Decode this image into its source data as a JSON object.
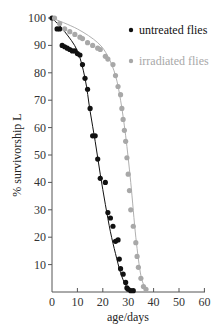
{
  "chart_data": {
    "type": "scatter",
    "title": "",
    "xlabel": "age/days",
    "ylabel": "% survivorship L",
    "xlim": [
      0,
      60
    ],
    "ylim": [
      0,
      100
    ],
    "xticks": [
      0,
      10,
      20,
      30,
      40,
      50,
      60
    ],
    "yticks": [
      10,
      20,
      30,
      40,
      50,
      60,
      70,
      80,
      90,
      100
    ],
    "grid": false,
    "legend_position": "upper right",
    "series": [
      {
        "name": "untreated flies",
        "color": "#111111",
        "marker": "filled-circle",
        "points": [
          [
            0,
            100
          ],
          [
            2,
            96
          ],
          [
            3,
            96
          ],
          [
            4,
            90
          ],
          [
            5,
            89.5
          ],
          [
            6,
            89
          ],
          [
            7,
            88.5
          ],
          [
            8,
            88
          ],
          [
            9,
            88
          ],
          [
            10,
            87
          ],
          [
            11,
            86.5
          ],
          [
            12,
            83
          ],
          [
            13,
            78
          ],
          [
            14,
            74
          ],
          [
            15,
            67
          ],
          [
            16,
            57
          ],
          [
            17,
            57
          ],
          [
            18,
            48.5
          ],
          [
            19,
            41.5
          ],
          [
            21,
            40
          ],
          [
            22,
            29
          ],
          [
            23,
            27
          ],
          [
            24,
            24
          ],
          [
            25,
            18.5
          ],
          [
            26,
            19
          ],
          [
            26.5,
            12
          ],
          [
            27,
            8.5
          ],
          [
            28,
            6.5
          ],
          [
            29,
            3.5
          ],
          [
            29.5,
            1.5
          ],
          [
            30,
            1
          ],
          [
            31,
            0.5
          ],
          [
            32,
            0.5
          ]
        ],
        "fit_curve": [
          [
            0,
            100
          ],
          [
            5,
            95
          ],
          [
            10,
            88
          ],
          [
            13,
            78
          ],
          [
            15,
            66
          ],
          [
            17,
            55
          ],
          [
            19,
            43
          ],
          [
            21,
            32
          ],
          [
            23,
            22
          ],
          [
            25,
            14
          ],
          [
            27,
            7
          ],
          [
            29,
            2.5
          ],
          [
            31,
            0.5
          ]
        ]
      },
      {
        "name": "irradiated flies",
        "color": "#a8a8a8",
        "marker": "filled-circle",
        "points": [
          [
            1,
            100
          ],
          [
            3,
            98
          ],
          [
            5,
            96
          ],
          [
            7,
            95
          ],
          [
            9,
            94
          ],
          [
            11,
            93
          ],
          [
            12,
            92.5
          ],
          [
            14,
            91
          ],
          [
            16,
            90
          ],
          [
            18,
            89
          ],
          [
            19,
            88.5
          ],
          [
            21,
            86
          ],
          [
            22,
            85
          ],
          [
            24,
            83
          ],
          [
            25,
            79
          ],
          [
            26,
            75
          ],
          [
            27,
            72
          ],
          [
            27.5,
            67
          ],
          [
            28,
            63
          ],
          [
            28.5,
            59
          ],
          [
            29,
            55
          ],
          [
            29.5,
            49
          ],
          [
            30,
            43
          ],
          [
            30.5,
            37
          ],
          [
            31,
            30
          ],
          [
            32,
            24
          ],
          [
            33,
            18
          ],
          [
            33.5,
            13
          ],
          [
            34,
            9
          ],
          [
            35,
            5
          ],
          [
            36,
            2
          ],
          [
            37,
            1
          ]
        ],
        "fit_curve": [
          [
            0,
            100
          ],
          [
            10,
            96
          ],
          [
            18,
            91
          ],
          [
            22,
            86
          ],
          [
            25,
            79
          ],
          [
            27,
            70
          ],
          [
            29,
            57
          ],
          [
            31,
            40
          ],
          [
            33,
            20
          ],
          [
            35,
            6
          ],
          [
            37,
            1
          ]
        ]
      }
    ]
  },
  "legend": {
    "items": [
      {
        "label": "untreated flies",
        "color": "#111111"
      },
      {
        "label": "irradiated flies",
        "color": "#a8a8a8"
      }
    ]
  },
  "axes": {
    "x_title": "age/days",
    "y_title": "% survivorship L",
    "x_tick_labels": [
      "0",
      "10",
      "20",
      "30",
      "40",
      "50",
      "60"
    ],
    "y_tick_labels": [
      "10",
      "20",
      "30",
      "40",
      "50",
      "60",
      "70",
      "80",
      "90",
      "100"
    ]
  }
}
